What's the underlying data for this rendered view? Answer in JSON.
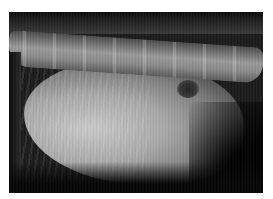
{
  "image": {
    "subject": "lateral abdominal radiograph",
    "description": "Grayscale X-ray showing spine along top, ribs on left, abdominal soft tissue, small dark gas pocket mid-right",
    "colors": {
      "background": "#ffffff",
      "film_dark": "#1a1a1a",
      "bone": "#9a9a9a",
      "soft_tissue": "#c9c9c9",
      "gas": "#202020"
    }
  }
}
